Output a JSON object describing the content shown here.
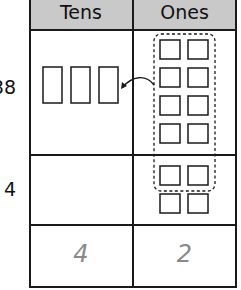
{
  "table": {
    "headers": [
      "Tens",
      "Ones"
    ],
    "rows": [
      {
        "label": "38",
        "tens": 3,
        "ones": 8
      },
      {
        "label": "4",
        "tens": 0,
        "ones": 4
      }
    ],
    "answer": {
      "tens": "4",
      "ones": "2"
    }
  },
  "regroup": {
    "grouped_ones": 10,
    "arrow": "ones-to-tens"
  },
  "colors": {
    "header_bg": "#c9c9c9",
    "line": "#1a1a1a",
    "answer_text": "#8a8a8a"
  }
}
